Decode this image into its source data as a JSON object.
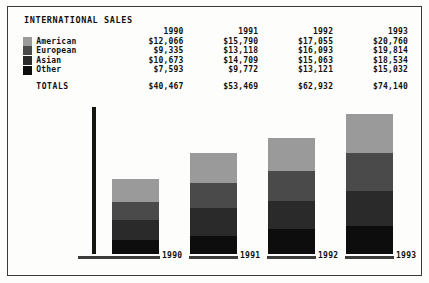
{
  "report": {
    "title": "INTERNATIONAL SALES",
    "column_headers": [
      "1990",
      "1991",
      "1992",
      "1993"
    ],
    "rows": [
      {
        "label": "American",
        "swatch_color": "#9a9a9a",
        "values": [
          "$12,066",
          "$15,790",
          "$17,055",
          "$20,760"
        ]
      },
      {
        "label": "European",
        "swatch_color": "#4a4a4a",
        "values": [
          "$9,335",
          "$13,118",
          "$16,093",
          "$19,814"
        ]
      },
      {
        "label": "Asian",
        "swatch_color": "#2a2a2a",
        "values": [
          "$10,673",
          "$14,709",
          "$15,063",
          "$18,534"
        ]
      },
      {
        "label": "Other",
        "swatch_color": "#0d0d0d",
        "values": [
          "$7,593",
          "$9,772",
          "$13,121",
          "$15,032"
        ]
      }
    ],
    "totals_label": "TOTALS",
    "totals": [
      "$40,467",
      "$53,469",
      "$62,932",
      "$74,140"
    ]
  },
  "chart_data": {
    "type": "bar",
    "stacked": true,
    "title": "INTERNATIONAL SALES",
    "xlabel": "",
    "ylabel": "",
    "categories": [
      "1990",
      "1991",
      "1992",
      "1993"
    ],
    "series": [
      {
        "name": "Other",
        "color": "#0d0d0d",
        "values": [
          7593,
          9772,
          13121,
          15032
        ]
      },
      {
        "name": "Asian",
        "color": "#2a2a2a",
        "values": [
          10673,
          14709,
          15063,
          18534
        ]
      },
      {
        "name": "European",
        "color": "#4a4a4a",
        "values": [
          9335,
          13118,
          16093,
          19814
        ]
      },
      {
        "name": "American",
        "color": "#9a9a9a",
        "values": [
          12066,
          15790,
          17055,
          20760
        ]
      }
    ],
    "totals": [
      40467,
      53469,
      62932,
      74140
    ],
    "ylim": [
      0,
      78000
    ],
    "grid": false,
    "legend_position": "top-left"
  },
  "axis": {
    "labels": [
      "1990",
      "1991",
      "1992",
      "1993"
    ]
  }
}
